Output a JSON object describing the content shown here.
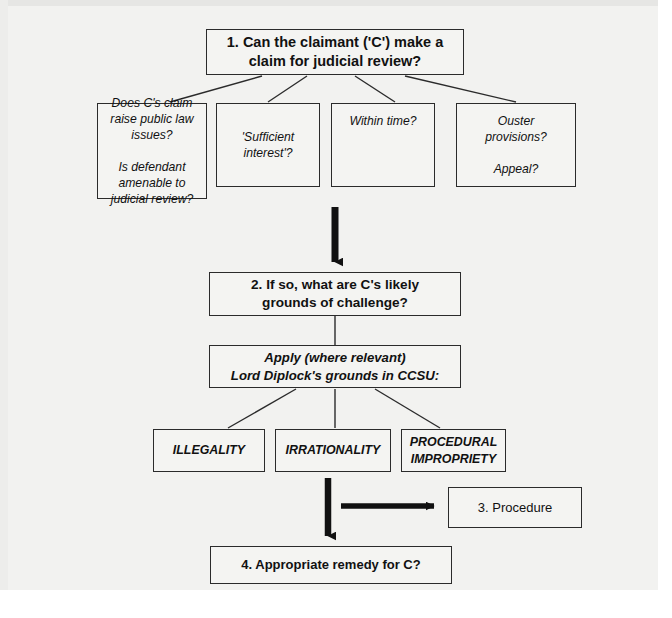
{
  "diagram": {
    "background_color": "#f2f2f0",
    "line_color": "#2b2b2b",
    "arrow_color": "#111111",
    "nodes": {
      "q1": {
        "id": "1",
        "label": "1. Can the claimant ('C') make a\nclaim for judicial review?"
      },
      "public_law": {
        "label": "Does C's claim\nraise public law\nissues?\n\nIs defendant\namenable to\njudicial review?"
      },
      "sufficient_interest": {
        "label": "'Sufficient\ninterest'?"
      },
      "within_time": {
        "label": "Within time?"
      },
      "ouster": {
        "label": "Ouster\nprovisions?\n\nAppeal?"
      },
      "q2": {
        "id": "2",
        "label": "2. If so, what are C's likely\ngrounds of challenge?"
      },
      "apply": {
        "label": "Apply (where relevant)\nLord Diplock's grounds in CCSU:"
      },
      "illegality": {
        "label": "ILLEGALITY"
      },
      "irrationality": {
        "label": "IRRATIONALITY"
      },
      "procedural_impropriety": {
        "label": "PROCEDURAL\nIMPROPRIETY"
      },
      "q3": {
        "id": "3",
        "label": "3. Procedure"
      },
      "q4": {
        "id": "4",
        "label": "4. Appropriate remedy for C?"
      }
    },
    "connectors": [
      {
        "name": "q1-to-public-law",
        "type": "line"
      },
      {
        "name": "q1-to-sufficient-interest",
        "type": "line"
      },
      {
        "name": "q1-to-within-time",
        "type": "line"
      },
      {
        "name": "q1-to-ouster",
        "type": "line"
      },
      {
        "name": "row2-to-q2",
        "type": "arrow-down"
      },
      {
        "name": "q2-to-apply",
        "type": "line"
      },
      {
        "name": "apply-to-illegality",
        "type": "line"
      },
      {
        "name": "apply-to-irrationality",
        "type": "line"
      },
      {
        "name": "apply-to-procedural",
        "type": "line"
      },
      {
        "name": "grounds-to-q4",
        "type": "arrow-down"
      },
      {
        "name": "stem-to-q3",
        "type": "arrow-right"
      }
    ]
  }
}
